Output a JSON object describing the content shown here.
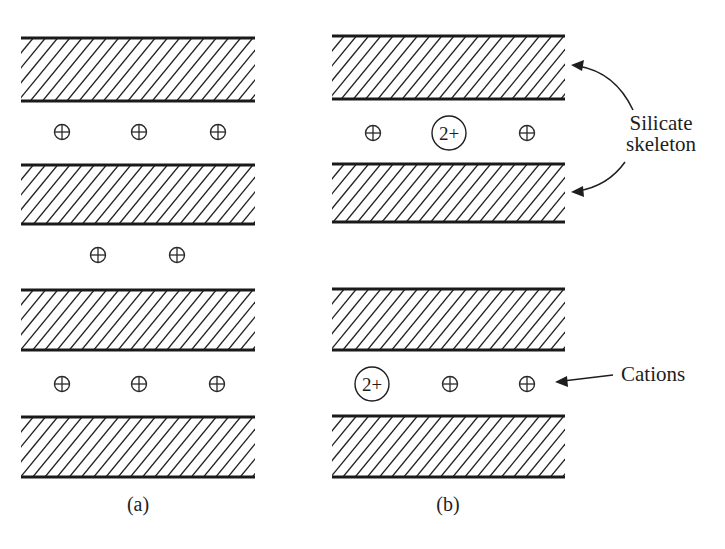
{
  "figure": {
    "panels": [
      {
        "id": "a",
        "label": "(a)",
        "layer_count": 4,
        "interlayer_rows": [
          [
            "+",
            "+",
            "+"
          ],
          [
            "+",
            "+"
          ],
          [
            "+",
            "+",
            "+"
          ]
        ]
      },
      {
        "id": "b",
        "label": "(b)",
        "layer_count": 4,
        "interlayer_rows": [
          [
            "+",
            "2+",
            "+"
          ],
          [],
          [
            "2+",
            "+",
            "+"
          ]
        ]
      }
    ],
    "annotations": {
      "silicate_line1": "Silicate",
      "silicate_line2": "skeleton",
      "cations": "Cations"
    },
    "colors": {
      "ink": "#1e1e1e",
      "background": "#ffffff"
    }
  }
}
